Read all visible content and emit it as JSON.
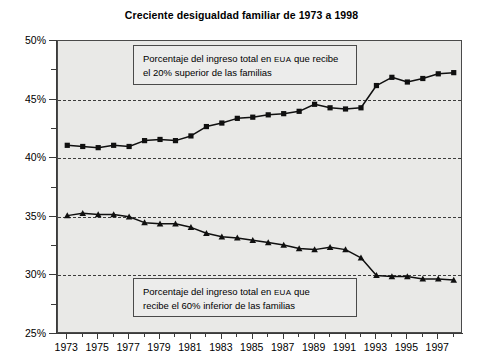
{
  "chart_data": {
    "type": "line",
    "title": "Creciente desigualdad familiar de 1973 a 1998",
    "xlabel": "",
    "ylabel": "",
    "xlim": [
      1972.4,
      1998.6
    ],
    "ylim": [
      25,
      50
    ],
    "ytick_labels": [
      "25%",
      "30%",
      "35%",
      "40%",
      "45%",
      "50%"
    ],
    "ytick_values": [
      25,
      30,
      35,
      40,
      45,
      50
    ],
    "yminor_values": [
      27.5,
      32.5,
      37.5,
      42.5,
      47.5
    ],
    "xtick_labels": [
      "1973",
      "1975",
      "1977",
      "1979",
      "1981",
      "1983",
      "1985",
      "1987",
      "1989",
      "1991",
      "1993",
      "1995",
      "1997"
    ],
    "xtick_values": [
      1973,
      1975,
      1977,
      1979,
      1981,
      1983,
      1985,
      1987,
      1989,
      1991,
      1993,
      1995,
      1997
    ],
    "xminor_values": [
      1974,
      1976,
      1978,
      1980,
      1982,
      1984,
      1986,
      1988,
      1990,
      1992,
      1994,
      1996,
      1998
    ],
    "grid": "horizontal-dashed",
    "legend_position": "inline-annotations",
    "x": [
      1973,
      1974,
      1975,
      1976,
      1977,
      1978,
      1979,
      1980,
      1981,
      1982,
      1983,
      1984,
      1985,
      1986,
      1987,
      1988,
      1989,
      1990,
      1991,
      1992,
      1993,
      1994,
      1995,
      1996,
      1997,
      1998
    ],
    "series": [
      {
        "name": "Porcentaje del ingreso total en EUA que recibe el 20% superior de las familias",
        "marker": "square",
        "color": "#101010",
        "values": [
          41.1,
          41.0,
          40.9,
          41.1,
          41.0,
          41.5,
          41.6,
          41.5,
          41.9,
          42.7,
          43.0,
          43.4,
          43.5,
          43.7,
          43.8,
          44.0,
          44.6,
          44.3,
          44.2,
          44.3,
          46.2,
          46.9,
          46.5,
          46.8,
          47.2,
          47.3
        ]
      },
      {
        "name": "Porcentaje del ingreso total en EUA que recibe el 60% inferior de las familias",
        "marker": "triangle",
        "color": "#101010",
        "values": [
          35.1,
          35.3,
          35.2,
          35.2,
          35.0,
          34.5,
          34.4,
          34.4,
          34.1,
          33.6,
          33.3,
          33.2,
          33.0,
          32.8,
          32.6,
          32.3,
          32.2,
          32.4,
          32.2,
          31.5,
          30.0,
          29.9,
          29.9,
          29.7,
          29.7,
          29.6
        ]
      }
    ]
  },
  "annotations": {
    "top": {
      "line1_a": "Porcentaje del ingreso total en ",
      "line1_b": "EUA",
      "line1_c": " que recibe",
      "line2": "el 20% superior de las familias"
    },
    "bottom": {
      "line1_a": "Porcentaje del ingreso total en ",
      "line1_b": "EUA",
      "line1_c": " que",
      "line2": "recibe el 60% inferior de las familias"
    }
  }
}
